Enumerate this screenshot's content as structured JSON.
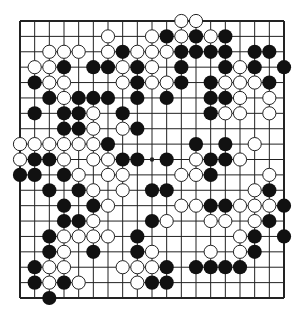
{
  "diagram": {
    "type": "go-board",
    "size": 19,
    "colors": {
      "background": "#ffffff",
      "line": "#222222",
      "black_stone": "#111111",
      "white_stone": "#ffffff",
      "white_stroke": "#222222"
    },
    "star_points": [
      [
        9,
        9
      ]
    ],
    "stones": {
      "black": [
        [
          10,
          1
        ],
        [
          12,
          1
        ],
        [
          14,
          1
        ],
        [
          7,
          2
        ],
        [
          11,
          2
        ],
        [
          12,
          2
        ],
        [
          13,
          2
        ],
        [
          14,
          2
        ],
        [
          16,
          2
        ],
        [
          17,
          2
        ],
        [
          3,
          3
        ],
        [
          5,
          3
        ],
        [
          6,
          3
        ],
        [
          8,
          3
        ],
        [
          11,
          3
        ],
        [
          14,
          3
        ],
        [
          16,
          3
        ],
        [
          18,
          3
        ],
        [
          1,
          4
        ],
        [
          8,
          4
        ],
        [
          11,
          4
        ],
        [
          13,
          4
        ],
        [
          17,
          4
        ],
        [
          2,
          5
        ],
        [
          4,
          5
        ],
        [
          5,
          5
        ],
        [
          6,
          5
        ],
        [
          8,
          5
        ],
        [
          10,
          5
        ],
        [
          13,
          5
        ],
        [
          14,
          5
        ],
        [
          1,
          6
        ],
        [
          3,
          6
        ],
        [
          4,
          6
        ],
        [
          7,
          6
        ],
        [
          13,
          6
        ],
        [
          3,
          7
        ],
        [
          4,
          7
        ],
        [
          8,
          7
        ],
        [
          6,
          8
        ],
        [
          12,
          8
        ],
        [
          14,
          8
        ],
        [
          1,
          9
        ],
        [
          2,
          9
        ],
        [
          7,
          9
        ],
        [
          8,
          9
        ],
        [
          10,
          9
        ],
        [
          13,
          9
        ],
        [
          14,
          9
        ],
        [
          0,
          10
        ],
        [
          1,
          10
        ],
        [
          3,
          10
        ],
        [
          13,
          10
        ],
        [
          2,
          11
        ],
        [
          4,
          11
        ],
        [
          9,
          11
        ],
        [
          10,
          11
        ],
        [
          17,
          11
        ],
        [
          3,
          12
        ],
        [
          5,
          12
        ],
        [
          13,
          12
        ],
        [
          14,
          12
        ],
        [
          18,
          12
        ],
        [
          3,
          13
        ],
        [
          4,
          13
        ],
        [
          9,
          13
        ],
        [
          17,
          13
        ],
        [
          2,
          14
        ],
        [
          8,
          14
        ],
        [
          16,
          14
        ],
        [
          18,
          14
        ],
        [
          2,
          15
        ],
        [
          5,
          15
        ],
        [
          8,
          15
        ],
        [
          16,
          15
        ],
        [
          1,
          16
        ],
        [
          10,
          16
        ],
        [
          12,
          16
        ],
        [
          13,
          16
        ],
        [
          14,
          16
        ],
        [
          15,
          16
        ],
        [
          1,
          17
        ],
        [
          3,
          17
        ],
        [
          9,
          17
        ],
        [
          10,
          17
        ],
        [
          2,
          18
        ]
      ],
      "white": [
        [
          11,
          0
        ],
        [
          12,
          0
        ],
        [
          6,
          1
        ],
        [
          9,
          1
        ],
        [
          11,
          1
        ],
        [
          13,
          1
        ],
        [
          2,
          2
        ],
        [
          3,
          2
        ],
        [
          4,
          2
        ],
        [
          6,
          2
        ],
        [
          8,
          2
        ],
        [
          9,
          2
        ],
        [
          10,
          2
        ],
        [
          1,
          3
        ],
        [
          2,
          3
        ],
        [
          7,
          3
        ],
        [
          9,
          3
        ],
        [
          15,
          3
        ],
        [
          2,
          4
        ],
        [
          3,
          4
        ],
        [
          7,
          4
        ],
        [
          9,
          4
        ],
        [
          10,
          4
        ],
        [
          14,
          4
        ],
        [
          15,
          4
        ],
        [
          16,
          4
        ],
        [
          3,
          5
        ],
        [
          15,
          5
        ],
        [
          17,
          5
        ],
        [
          5,
          6
        ],
        [
          14,
          6
        ],
        [
          15,
          6
        ],
        [
          17,
          6
        ],
        [
          5,
          7
        ],
        [
          7,
          7
        ],
        [
          0,
          8
        ],
        [
          1,
          8
        ],
        [
          2,
          8
        ],
        [
          3,
          8
        ],
        [
          4,
          8
        ],
        [
          5,
          8
        ],
        [
          16,
          8
        ],
        [
          0,
          9
        ],
        [
          3,
          9
        ],
        [
          5,
          9
        ],
        [
          6,
          9
        ],
        [
          12,
          9
        ],
        [
          15,
          9
        ],
        [
          4,
          10
        ],
        [
          6,
          10
        ],
        [
          7,
          10
        ],
        [
          11,
          10
        ],
        [
          12,
          10
        ],
        [
          17,
          10
        ],
        [
          5,
          11
        ],
        [
          7,
          11
        ],
        [
          16,
          11
        ],
        [
          6,
          12
        ],
        [
          11,
          12
        ],
        [
          12,
          12
        ],
        [
          15,
          12
        ],
        [
          16,
          12
        ],
        [
          17,
          12
        ],
        [
          5,
          13
        ],
        [
          10,
          13
        ],
        [
          13,
          13
        ],
        [
          14,
          13
        ],
        [
          16,
          13
        ],
        [
          3,
          14
        ],
        [
          4,
          14
        ],
        [
          5,
          14
        ],
        [
          6,
          14
        ],
        [
          15,
          14
        ],
        [
          3,
          15
        ],
        [
          9,
          15
        ],
        [
          13,
          15
        ],
        [
          15,
          15
        ],
        [
          2,
          16
        ],
        [
          3,
          16
        ],
        [
          7,
          16
        ],
        [
          8,
          16
        ],
        [
          9,
          16
        ],
        [
          2,
          17
        ],
        [
          4,
          17
        ],
        [
          8,
          17
        ]
      ]
    }
  }
}
